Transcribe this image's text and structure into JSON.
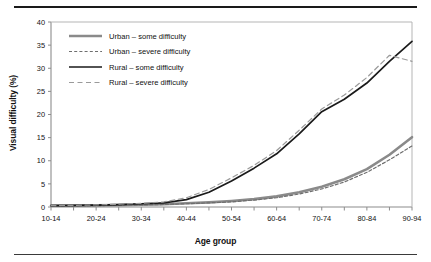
{
  "figure": {
    "has_top_rule": true,
    "has_bottom_rule": true
  },
  "chart_data": {
    "type": "line",
    "title": "",
    "xlabel": "Age group",
    "ylabel": "Visual difficulty (%)",
    "ylim": [
      0,
      40
    ],
    "yticks": [
      0,
      5,
      10,
      15,
      20,
      25,
      30,
      35,
      40
    ],
    "ytick_labels": [
      "0",
      "5",
      "10",
      "15",
      "20",
      "25",
      "30",
      "35",
      "40"
    ],
    "grid": false,
    "legend_position": "upper left inside axes",
    "categories": [
      "10-14",
      "15-19",
      "20-24",
      "25-29",
      "30-34",
      "35-39",
      "40-44",
      "45-49",
      "50-54",
      "55-59",
      "60-64",
      "65-69",
      "70-74",
      "75-79",
      "80-84",
      "85-89",
      "90-94"
    ],
    "xtick_labels": [
      "10-14",
      "",
      "20-24",
      "",
      "30-34",
      "",
      "40-44",
      "",
      "50-54",
      "",
      "60-64",
      "",
      "70-74",
      "",
      "80-84",
      "",
      "90-94"
    ],
    "series": [
      {
        "name": "Urban - some difficulty",
        "legend_label": "Urban – some difficulty",
        "color": "#8a8a8a",
        "style": "solid",
        "width": 2.6,
        "values": [
          0.3,
          0.3,
          0.35,
          0.4,
          0.5,
          0.6,
          0.8,
          1.0,
          1.3,
          1.7,
          2.3,
          3.2,
          4.4,
          6.0,
          8.2,
          11.3,
          15.1
        ]
      },
      {
        "name": "Urban - severe difficulty",
        "legend_label": "Urban – severe difficulty",
        "color": "#6e6e6e",
        "style": "dashed",
        "width": 1.2,
        "values": [
          0.25,
          0.25,
          0.3,
          0.35,
          0.45,
          0.55,
          0.7,
          0.9,
          1.1,
          1.5,
          2.0,
          2.8,
          3.9,
          5.4,
          7.5,
          10.2,
          13.2
        ]
      },
      {
        "name": "Rural - some difficulty",
        "legend_label": "Rural – some difficulty",
        "color": "#1a1a1a",
        "style": "solid",
        "width": 1.7,
        "values": [
          0.3,
          0.35,
          0.4,
          0.5,
          0.7,
          0.9,
          1.6,
          3.2,
          5.6,
          8.4,
          11.5,
          15.8,
          20.6,
          23.3,
          26.8,
          31.5,
          35.8
        ]
      },
      {
        "name": "Rural - severe difficulty",
        "legend_label": "Rural – severe difficulty",
        "color": "#9a9a9a",
        "style": "dashed",
        "width": 1.2,
        "values": [
          0.3,
          0.35,
          0.45,
          0.6,
          0.8,
          1.1,
          2.0,
          3.8,
          6.3,
          9.0,
          12.2,
          16.6,
          21.2,
          24.2,
          28.0,
          32.8,
          31.5
        ]
      }
    ]
  }
}
